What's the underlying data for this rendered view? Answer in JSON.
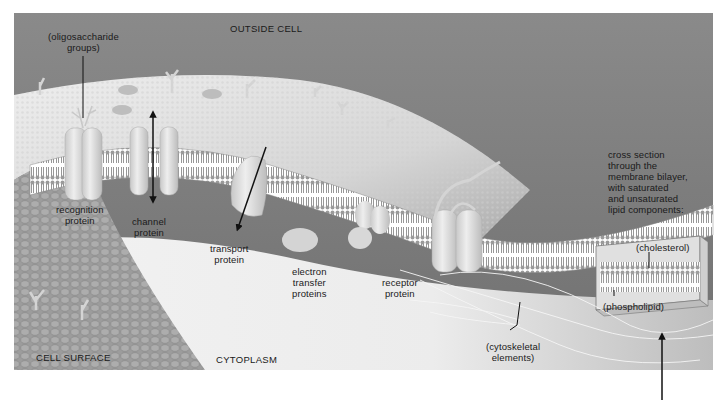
{
  "figure": {
    "colors": {
      "background_outside": "#7e7e7e",
      "membrane_surface": "#e6e6e6",
      "cytoplasm": "#efefef",
      "cell_surface_texture": "#9a9a9a",
      "protein": "#d9d9d9",
      "label_text": "#1a1a1a",
      "arrow": "#111111"
    }
  },
  "regions": {
    "outside_cell": "OUTSIDE CELL",
    "cell_surface": "CELL SURFACE",
    "cytoplasm": "CYTOPLASM"
  },
  "labels": {
    "oligosaccharide": "(oligosaccharide\ngroups)",
    "recognition_protein": "recognition\nprotein",
    "channel_protein": "channel\nprotein",
    "transport_protein": "transport\nprotein",
    "electron_transfer": "electron\ntransfer\nproteins",
    "receptor_protein": "receptor\nprotein",
    "cytoskeletal": "(cytoskeletal\nelements)",
    "cross_section": "cross section\nthrough the\nmembrane bilayer,\nwith saturated\nand unsaturated\nlipid components:",
    "cholesterol": "(cholesterol)",
    "phospholipid": "(phospholipid)"
  }
}
